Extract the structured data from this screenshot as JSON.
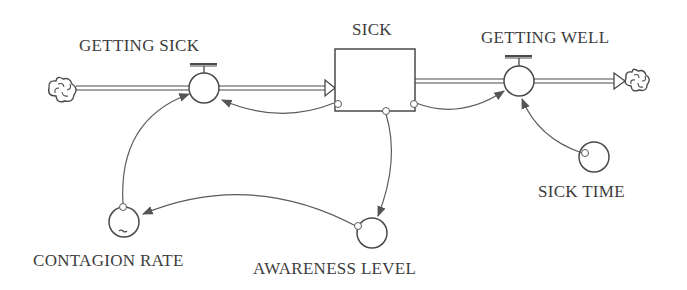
{
  "diagram": {
    "type": "stock-and-flow",
    "colors": {
      "stroke": "#4a4a4a",
      "text": "#3c3c3c",
      "background": "#ffffff"
    },
    "stocks": [
      {
        "id": "sick",
        "label": "SICK"
      }
    ],
    "flows": [
      {
        "id": "getting_sick",
        "label": "GETTING SICK",
        "from": "source-cloud",
        "to": "sick"
      },
      {
        "id": "getting_well",
        "label": "GETTING WELL",
        "from": "sick",
        "to": "sink-cloud"
      }
    ],
    "converters": [
      {
        "id": "contagion_rate",
        "label": "CONTAGION RATE",
        "graphical": true
      },
      {
        "id": "awareness_level",
        "label": "AWARENESS LEVEL"
      },
      {
        "id": "sick_time",
        "label": "SICK TIME"
      }
    ],
    "connectors": [
      {
        "from": "sick",
        "to": "getting_sick"
      },
      {
        "from": "contagion_rate",
        "to": "getting_sick"
      },
      {
        "from": "sick",
        "to": "getting_well"
      },
      {
        "from": "sick_time",
        "to": "getting_well"
      },
      {
        "from": "sick",
        "to": "awareness_level"
      },
      {
        "from": "awareness_level",
        "to": "contagion_rate"
      }
    ]
  },
  "labels": {
    "sick": "SICK",
    "getting_sick": "GETTING SICK",
    "getting_well": "GETTING WELL",
    "contagion_rate": "CONTAGION RATE",
    "awareness_level": "AWARENESS LEVEL",
    "sick_time": "SICK TIME"
  }
}
